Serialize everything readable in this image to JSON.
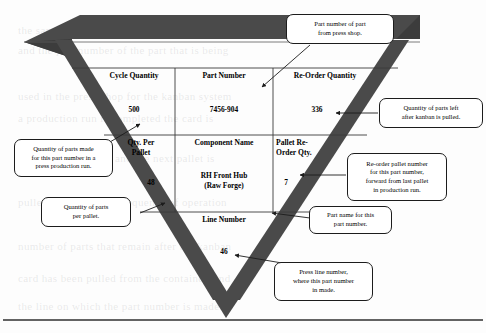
{
  "page": {
    "background_color": "#fdfdfd",
    "band_color": "#4a4a4a",
    "line_color": "#1c1c1c"
  },
  "card": {
    "shape": "inverted-triangle",
    "rows": [
      {
        "headers": [
          "Cycle Quantity",
          "Part Number",
          "Re-Order Quantity"
        ],
        "values": [
          "500",
          "7456-904",
          "336"
        ]
      },
      {
        "headers": [
          "Qty.   Per\nPallet",
          "Component Name",
          "Pallet  Re-\nOrder  Qty."
        ],
        "values": [
          "48",
          "RH Front Hub\n(Raw Forge)",
          "7"
        ]
      },
      {
        "headers": [
          "Line Number"
        ],
        "values": [
          "46"
        ]
      }
    ],
    "fields": {
      "cycle_quantity_label": "Cycle Quantity",
      "cycle_quantity_value": "500",
      "part_number_label": "Part Number",
      "part_number_value": "7456-904",
      "reorder_quantity_label": "Re-Order Quantity",
      "reorder_quantity_value": "336",
      "qty_per_pallet_label_line1": "Qty.    Per",
      "qty_per_pallet_label_line2": "Pallet",
      "qty_per_pallet_value": "48",
      "component_name_label": "Component Name",
      "component_name_value_line1": "RH Front Hub",
      "component_name_value_line2": "(Raw Forge)",
      "pallet_reorder_label_line1": "Pallet  Re-",
      "pallet_reorder_label_line2": "Order  Qty.",
      "pallet_reorder_value": "7",
      "line_number_label": "Line Number",
      "line_number_value": "46"
    }
  },
  "callouts": [
    {
      "id": "part-number-callout",
      "lines": [
        "Part number of part",
        "from press shop."
      ],
      "points_to": "part_number_label"
    },
    {
      "id": "reorder-quantity-callout",
      "lines": [
        "Quantity of parts left",
        "after kanban is pulled."
      ],
      "points_to": "reorder_quantity_value"
    },
    {
      "id": "pallet-reorder-callout",
      "lines": [
        "Re-order pallet number",
        "for this part number,",
        "forward from last pallet",
        "in production run."
      ],
      "points_to": "pallet_reorder_value"
    },
    {
      "id": "part-name-callout",
      "lines": [
        "Part name for this",
        "part number."
      ],
      "points_to": "component_name_value"
    },
    {
      "id": "line-number-callout",
      "lines": [
        "Press line number,",
        "where this part number",
        "in made."
      ],
      "points_to": "line_number_value"
    },
    {
      "id": "cycle-quantity-callout",
      "lines": [
        "Quantity of parts made",
        "for this part number in a",
        "press production run."
      ],
      "points_to": "cycle_quantity_value"
    },
    {
      "id": "qty-per-pallet-callout",
      "lines": [
        "Quantity of parts",
        "per pallet."
      ],
      "points_to": "qty_per_pallet_value"
    }
  ],
  "bleed_text": [
    "the same information as the front but in a different",
    "and the part number of the part that is being",
    "used in the press shop for the kanban system",
    "a production run is completed the card is",
    "returned to the rack and the next pallet is",
    "pulled forward in the sequence of operation",
    "number of parts that remain after the kanban",
    "card has been pulled from the container, and",
    "the line on which the part number is made."
  ]
}
